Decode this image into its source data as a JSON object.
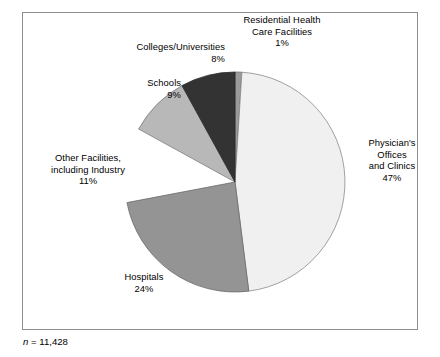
{
  "figure": {
    "background": "#ffffff",
    "frame_color": "#8d8d8d"
  },
  "footnote": {
    "symbol": "n",
    "text": " = 11,428",
    "full": "n = 11,428"
  },
  "labels": {
    "residential": {
      "name": "Residential Health Care Facilities",
      "line1": "Residential Health",
      "line2": "Care Facilities",
      "pct": "1%"
    },
    "colleges": {
      "name": "Colleges/Universities",
      "line1": "Colleges/Universities",
      "pct": "8%"
    },
    "schools": {
      "name": "Schools",
      "line1": "Schools",
      "pct": "9%"
    },
    "other": {
      "name": "Other Facilities, including Industry",
      "line1": "Other Facilities,",
      "line2": "including Industry",
      "pct": "11%"
    },
    "hospitals": {
      "name": "Hospitals",
      "line1": "Hospitals",
      "pct": "24%"
    },
    "physicians": {
      "name": "Physician's Offices and Clinics",
      "line1": "Physician's",
      "line2": "Offices",
      "line3": "and Clinics",
      "pct": "47%"
    }
  },
  "chart_data": {
    "type": "pie",
    "title": "",
    "subtitle": "",
    "xlabel": "",
    "ylabel": "",
    "total_n": 11428,
    "units": "percent",
    "start_angle_deg": 0,
    "direction": "clockwise",
    "center": {
      "cx": 235,
      "cy": 182
    },
    "radius": 110,
    "legend_position": "none",
    "grid": false,
    "labels_inline": true,
    "slices": [
      {
        "label": "Residential Health Care Facilities",
        "value": 1,
        "display": "1%",
        "color": "#9a9a9a",
        "stroke": "#6b6b6b",
        "exploded": false,
        "start_deg": 0,
        "end_deg": 3.6
      },
      {
        "label": "Physician's Offices and Clinics",
        "value": 47,
        "display": "47%",
        "color": "#f0f0f0",
        "stroke": "#8a8a8a",
        "exploded": false,
        "start_deg": 3.6,
        "end_deg": 172.8
      },
      {
        "label": "Hospitals",
        "value": 24,
        "display": "24%",
        "color": "#949494",
        "stroke": "#6b6b6b",
        "exploded": false,
        "start_deg": 172.8,
        "end_deg": 259.2
      },
      {
        "label": "Other Facilities, including Industry",
        "value": 11,
        "display": "11%",
        "color": "#ffffff",
        "stroke": "#ffffff",
        "exploded": true,
        "start_deg": 259.2,
        "end_deg": 298.8
      },
      {
        "label": "Schools",
        "value": 9,
        "display": "9%",
        "color": "#b8b8b8",
        "stroke": "#7d7d7d",
        "exploded": false,
        "start_deg": 298.8,
        "end_deg": 331.2
      },
      {
        "label": "Colleges/Universities",
        "value": 8,
        "display": "8%",
        "color": "#333333",
        "stroke": "#2a2a2a",
        "exploded": false,
        "start_deg": 331.2,
        "end_deg": 360
      }
    ]
  }
}
